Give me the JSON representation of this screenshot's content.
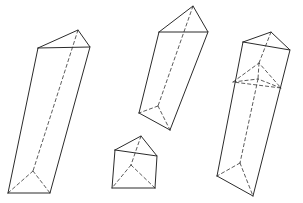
{
  "figure": {
    "background_color": "#ffffff",
    "solid_edge_color": "#2b2b2b",
    "hidden_edge_color": "#4a4a4a",
    "solid_edge_width": 1,
    "hidden_edge_width": 0.9,
    "hidden_edge_style": "dashed",
    "canvas": {
      "width": 303,
      "height": 203
    },
    "shape_count": 4
  },
  "shapes": [
    {
      "id": "prism-left",
      "name": "left-tall-prism",
      "label": "Tall triangular prism, leaning right",
      "top_face": {
        "front_left": [
          38,
          48
        ],
        "apex": [
          78,
          30
        ],
        "front_right": [
          90,
          47
        ]
      },
      "bottom_face": {
        "front_left": [
          8,
          193
        ],
        "hidden_back": [
          33,
          171
        ],
        "front_right": [
          50,
          193
        ]
      },
      "solid_edges": [
        "M38,48 L78,30 L90,47 L38,48 Z",
        "M38,48 L8,193",
        "M90,47 L50,193",
        "M8,193 L50,193"
      ],
      "hidden_edges": [
        "M78,30 L33,171",
        "M33,171 L8,193",
        "M33,171 L50,193"
      ]
    },
    {
      "id": "prism-middle-top",
      "name": "middle-upper-prism",
      "label": "Medium triangular prism, tilted",
      "top_face": {
        "front_left": [
          159,
          32
        ],
        "apex": [
          193,
          6
        ],
        "front_right": [
          208,
          32
        ]
      },
      "bottom_face": {
        "front_left": [
          139,
          113
        ],
        "hidden_back": [
          158,
          106
        ],
        "front_right": [
          170,
          130
        ]
      },
      "solid_edges": [
        "M159,32 L193,6 L208,32 L159,32 Z",
        "M159,32 L139,113",
        "M208,32 L170,130",
        "M139,113 L170,130"
      ],
      "hidden_edges": [
        "M193,6 L158,106",
        "M158,106 L139,113",
        "M158,106 L170,130"
      ]
    },
    {
      "id": "prism-middle-bottom",
      "name": "small-prism",
      "label": "Short triangular prism",
      "top_face": {
        "front_left": [
          115,
          150
        ],
        "apex": [
          141,
          136
        ],
        "front_right": [
          157,
          156
        ]
      },
      "bottom_face": {
        "front_left": [
          112,
          188
        ],
        "hidden_back": [
          131,
          165
        ],
        "front_right": [
          155,
          188
        ]
      },
      "solid_edges": [
        "M115,150 L141,136 L157,156 L115,150 Z",
        "M115,150 L112,188",
        "M157,156 L155,188",
        "M112,188 L155,188"
      ],
      "hidden_edges": [
        "M141,136 L131,165",
        "M131,165 L112,188",
        "M131,165 L155,188"
      ]
    },
    {
      "id": "prism-right",
      "name": "right-tall-prism",
      "label": "Tall triangular prism with dashed cross-section",
      "top_face": {
        "front_left": [
          243,
          42
        ],
        "apex": [
          271,
          32
        ],
        "front_right": [
          290,
          50
        ]
      },
      "cross_section": {
        "front_left": [
          233,
          82
        ],
        "hidden_back": [
          259,
          63
        ],
        "front_right": [
          281,
          88
        ],
        "center": [
          258,
          79
        ]
      },
      "bottom_face": {
        "front_left": [
          217,
          176
        ],
        "hidden_back": [
          240,
          163
        ],
        "front_right": [
          253,
          196
        ]
      },
      "solid_edges": [
        "M243,42 L271,32 L290,50 L243,42 Z",
        "M243,42 L217,176",
        "M290,50 L253,196",
        "M217,176 L253,196"
      ],
      "hidden_edges": [
        "M271,32 L259,63",
        "M233,82 L259,63 L281,88 L233,82 Z",
        "M259,63 L258,79",
        "M233,82 L258,79",
        "M281,88 L258,79",
        "M258,79 L240,163",
        "M240,163 L217,176",
        "M240,163 L253,196"
      ]
    }
  ]
}
